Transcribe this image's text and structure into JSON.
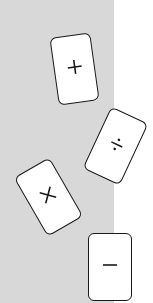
{
  "board": {
    "zone_color": "#d8d8d8",
    "background": "#ffffff"
  },
  "cards": [
    {
      "symbol": "plus",
      "glyph": "+",
      "icon": "plus-icon",
      "center": [
        74,
        69
      ],
      "rotation_deg": -8
    },
    {
      "symbol": "divide",
      "glyph": "÷",
      "icon": "divide-icon",
      "center": [
        115,
        146
      ],
      "rotation_deg": 25
    },
    {
      "symbol": "times",
      "glyph": "×",
      "icon": "times-icon",
      "center": [
        48,
        197
      ],
      "rotation_deg": -30
    },
    {
      "symbol": "minus",
      "glyph": "−",
      "icon": "minus-icon",
      "center": [
        110,
        267
      ],
      "rotation_deg": 0
    }
  ]
}
